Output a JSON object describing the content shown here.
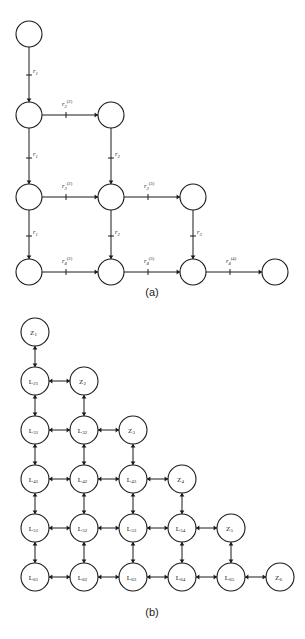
{
  "figure": {
    "panels": [
      {
        "id": "panel-a",
        "caption": "(a)",
        "caption_x": 152,
        "caption_y": 296,
        "description": "Directed lattice graph of transition stages with rate labels",
        "nodes": [
          {
            "name": "node-a-r1c1",
            "x": 29,
            "y": 34,
            "r": 13,
            "label": ""
          },
          {
            "name": "node-a-r2c1",
            "x": 29,
            "y": 115,
            "r": 13,
            "label": ""
          },
          {
            "name": "node-a-r2c2",
            "x": 111,
            "y": 115,
            "r": 13,
            "label": ""
          },
          {
            "name": "node-a-r3c1",
            "x": 29,
            "y": 197,
            "r": 13,
            "label": ""
          },
          {
            "name": "node-a-r3c2",
            "x": 111,
            "y": 197,
            "r": 13,
            "label": ""
          },
          {
            "name": "node-a-r3c3",
            "x": 193,
            "y": 197,
            "r": 13,
            "label": ""
          },
          {
            "name": "node-a-r4c1",
            "x": 29,
            "y": 272,
            "r": 13,
            "label": ""
          },
          {
            "name": "node-a-r4c2",
            "x": 111,
            "y": 272,
            "r": 13,
            "label": ""
          },
          {
            "name": "node-a-r4c3",
            "x": 193,
            "y": 272,
            "r": 13,
            "label": ""
          },
          {
            "name": "node-a-r4c4",
            "x": 275,
            "y": 272,
            "r": 13,
            "label": ""
          }
        ],
        "edges": [
          {
            "name": "edge-a-v-1",
            "from": "node-a-r1c1",
            "to": "node-a-r2c1",
            "dir": "down",
            "base": "r",
            "sub": "1",
            "sup": "",
            "lx": 33,
            "ly": 73
          },
          {
            "name": "edge-a-h-1",
            "from": "node-a-r2c1",
            "to": "node-a-r2c2",
            "dir": "right",
            "base": "r",
            "sub": "2",
            "sup": "(2)",
            "lx": 62,
            "ly": 106
          },
          {
            "name": "edge-a-v-2",
            "from": "node-a-r2c1",
            "to": "node-a-r3c1",
            "dir": "down",
            "base": "r",
            "sub": "1",
            "sup": "",
            "lx": 33,
            "ly": 156
          },
          {
            "name": "edge-a-v-3",
            "from": "node-a-r2c2",
            "to": "node-a-r3c2",
            "dir": "down",
            "base": "r",
            "sub": "2",
            "sup": "",
            "lx": 115,
            "ly": 156
          },
          {
            "name": "edge-a-h-2",
            "from": "node-a-r3c1",
            "to": "node-a-r3c2",
            "dir": "right",
            "base": "r",
            "sub": "3",
            "sup": "(2)",
            "lx": 62,
            "ly": 188
          },
          {
            "name": "edge-a-h-3",
            "from": "node-a-r3c2",
            "to": "node-a-r3c3",
            "dir": "right",
            "base": "r",
            "sub": "3",
            "sup": "(3)",
            "lx": 144,
            "ly": 188
          },
          {
            "name": "edge-a-v-4",
            "from": "node-a-r3c1",
            "to": "node-a-r4c1",
            "dir": "down",
            "base": "r",
            "sub": "1",
            "sup": "",
            "lx": 33,
            "ly": 234
          },
          {
            "name": "edge-a-v-5",
            "from": "node-a-r3c2",
            "to": "node-a-r4c2",
            "dir": "down",
            "base": "r",
            "sub": "2",
            "sup": "",
            "lx": 115,
            "ly": 234
          },
          {
            "name": "edge-a-v-6",
            "from": "node-a-r3c3",
            "to": "node-a-r4c3",
            "dir": "down",
            "base": "r",
            "sub": "3",
            "sup": "",
            "lx": 197,
            "ly": 234
          },
          {
            "name": "edge-a-h-4",
            "from": "node-a-r4c1",
            "to": "node-a-r4c2",
            "dir": "right",
            "base": "r",
            "sub": "4",
            "sup": "(2)",
            "lx": 62,
            "ly": 263
          },
          {
            "name": "edge-a-h-5",
            "from": "node-a-r4c2",
            "to": "node-a-r4c3",
            "dir": "right",
            "base": "r",
            "sub": "4",
            "sup": "(3)",
            "lx": 144,
            "ly": 263
          },
          {
            "name": "edge-a-h-6",
            "from": "node-a-r4c3",
            "to": "node-a-r4c4",
            "dir": "right",
            "base": "r",
            "sub": "4",
            "sup": "(4)",
            "lx": 226,
            "ly": 263
          }
        ]
      },
      {
        "id": "panel-b",
        "caption": "(b)",
        "caption_x": 152,
        "caption_y": 616,
        "description": "Bidirectional triangular lattice of L-states and Z-states",
        "nodes": [
          {
            "name": "node-b-z1",
            "x": 35,
            "y": 332,
            "r": 14,
            "label": "Z",
            "sub": "1"
          },
          {
            "name": "node-b-l21",
            "x": 35,
            "y": 381,
            "r": 14,
            "label": "L",
            "sub": "21"
          },
          {
            "name": "node-b-z2",
            "x": 84,
            "y": 381,
            "r": 14,
            "label": "Z",
            "sub": "2"
          },
          {
            "name": "node-b-l31",
            "x": 35,
            "y": 430,
            "r": 14,
            "label": "L",
            "sub": "31"
          },
          {
            "name": "node-b-l32",
            "x": 84,
            "y": 430,
            "r": 14,
            "label": "L",
            "sub": "32"
          },
          {
            "name": "node-b-z3",
            "x": 133,
            "y": 430,
            "r": 14,
            "label": "Z",
            "sub": "3"
          },
          {
            "name": "node-b-l41",
            "x": 35,
            "y": 479,
            "r": 14,
            "label": "L",
            "sub": "41"
          },
          {
            "name": "node-b-l42",
            "x": 84,
            "y": 479,
            "r": 14,
            "label": "L",
            "sub": "42"
          },
          {
            "name": "node-b-l43",
            "x": 133,
            "y": 479,
            "r": 14,
            "label": "L",
            "sub": "43"
          },
          {
            "name": "node-b-z4",
            "x": 182,
            "y": 479,
            "r": 14,
            "label": "Z",
            "sub": "4"
          },
          {
            "name": "node-b-l51",
            "x": 35,
            "y": 528,
            "r": 14,
            "label": "L",
            "sub": "51"
          },
          {
            "name": "node-b-l52",
            "x": 84,
            "y": 528,
            "r": 14,
            "label": "L",
            "sub": "52"
          },
          {
            "name": "node-b-l53",
            "x": 133,
            "y": 528,
            "r": 14,
            "label": "L",
            "sub": "53"
          },
          {
            "name": "node-b-l54",
            "x": 182,
            "y": 528,
            "r": 14,
            "label": "L",
            "sub": "54"
          },
          {
            "name": "node-b-z5",
            "x": 231,
            "y": 528,
            "r": 14,
            "label": "Z",
            "sub": "5"
          },
          {
            "name": "node-b-l61",
            "x": 35,
            "y": 577,
            "r": 14,
            "label": "L",
            "sub": "61"
          },
          {
            "name": "node-b-l62",
            "x": 84,
            "y": 577,
            "r": 14,
            "label": "L",
            "sub": "62"
          },
          {
            "name": "node-b-l63",
            "x": 133,
            "y": 577,
            "r": 14,
            "label": "L",
            "sub": "63"
          },
          {
            "name": "node-b-l64",
            "x": 182,
            "y": 577,
            "r": 14,
            "label": "L",
            "sub": "64"
          },
          {
            "name": "node-b-l65",
            "x": 231,
            "y": 577,
            "r": 14,
            "label": "L",
            "sub": "65"
          },
          {
            "name": "node-b-z6",
            "x": 280,
            "y": 577,
            "r": 14,
            "label": "Z",
            "sub": "6"
          }
        ],
        "edges": [
          {
            "name": "edge-b-z1-l21",
            "from": "node-b-z1",
            "to": "node-b-l21",
            "dir": "both"
          },
          {
            "name": "edge-b-l21-z2",
            "from": "node-b-l21",
            "to": "node-b-z2",
            "dir": "both"
          },
          {
            "name": "edge-b-l21-l31",
            "from": "node-b-l21",
            "to": "node-b-l31",
            "dir": "both"
          },
          {
            "name": "edge-b-z2-l32",
            "from": "node-b-z2",
            "to": "node-b-l32",
            "dir": "both"
          },
          {
            "name": "edge-b-l31-l32",
            "from": "node-b-l31",
            "to": "node-b-l32",
            "dir": "both"
          },
          {
            "name": "edge-b-l32-z3",
            "from": "node-b-l32",
            "to": "node-b-z3",
            "dir": "both"
          },
          {
            "name": "edge-b-l31-l41",
            "from": "node-b-l31",
            "to": "node-b-l41",
            "dir": "both"
          },
          {
            "name": "edge-b-l32-l42",
            "from": "node-b-l32",
            "to": "node-b-l42",
            "dir": "both"
          },
          {
            "name": "edge-b-z3-l43",
            "from": "node-b-z3",
            "to": "node-b-l43",
            "dir": "both"
          },
          {
            "name": "edge-b-l41-l42",
            "from": "node-b-l41",
            "to": "node-b-l42",
            "dir": "both"
          },
          {
            "name": "edge-b-l42-l43",
            "from": "node-b-l42",
            "to": "node-b-l43",
            "dir": "both"
          },
          {
            "name": "edge-b-l43-z4",
            "from": "node-b-l43",
            "to": "node-b-z4",
            "dir": "both"
          },
          {
            "name": "edge-b-l41-l51",
            "from": "node-b-l41",
            "to": "node-b-l51",
            "dir": "both"
          },
          {
            "name": "edge-b-l42-l52",
            "from": "node-b-l42",
            "to": "node-b-l52",
            "dir": "both"
          },
          {
            "name": "edge-b-l43-l53",
            "from": "node-b-l43",
            "to": "node-b-l53",
            "dir": "both"
          },
          {
            "name": "edge-b-z4-l54",
            "from": "node-b-z4",
            "to": "node-b-l54",
            "dir": "both"
          },
          {
            "name": "edge-b-l51-l52",
            "from": "node-b-l51",
            "to": "node-b-l52",
            "dir": "both"
          },
          {
            "name": "edge-b-l52-l53",
            "from": "node-b-l52",
            "to": "node-b-l53",
            "dir": "both"
          },
          {
            "name": "edge-b-l53-l54",
            "from": "node-b-l53",
            "to": "node-b-l54",
            "dir": "both"
          },
          {
            "name": "edge-b-l54-z5",
            "from": "node-b-l54",
            "to": "node-b-z5",
            "dir": "both"
          },
          {
            "name": "edge-b-l51-l61",
            "from": "node-b-l51",
            "to": "node-b-l61",
            "dir": "both"
          },
          {
            "name": "edge-b-l52-l62",
            "from": "node-b-l52",
            "to": "node-b-l62",
            "dir": "both"
          },
          {
            "name": "edge-b-l53-l63",
            "from": "node-b-l53",
            "to": "node-b-l63",
            "dir": "both"
          },
          {
            "name": "edge-b-l54-l64",
            "from": "node-b-l54",
            "to": "node-b-l64",
            "dir": "both"
          },
          {
            "name": "edge-b-z5-l65",
            "from": "node-b-z5",
            "to": "node-b-l65",
            "dir": "both"
          },
          {
            "name": "edge-b-l61-l62",
            "from": "node-b-l61",
            "to": "node-b-l62",
            "dir": "both"
          },
          {
            "name": "edge-b-l62-l63",
            "from": "node-b-l62",
            "to": "node-b-l63",
            "dir": "both"
          },
          {
            "name": "edge-b-l63-l64",
            "from": "node-b-l63",
            "to": "node-b-l64",
            "dir": "both"
          },
          {
            "name": "edge-b-l64-l65",
            "from": "node-b-l64",
            "to": "node-b-l65",
            "dir": "both"
          },
          {
            "name": "edge-b-l65-z6",
            "from": "node-b-l65",
            "to": "node-b-z6",
            "dir": "both"
          }
        ]
      }
    ],
    "colors": {
      "stroke": "#1a1a1a",
      "node_fill": "#ffffff",
      "background": "#ffffff"
    }
  }
}
